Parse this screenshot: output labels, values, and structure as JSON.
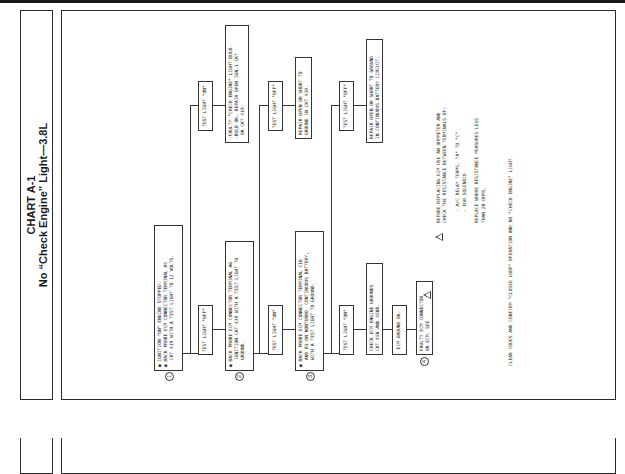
{
  "chart": {
    "id": "CHART A-1",
    "title": "No “Check Engine” Light—3.8L"
  },
  "steps": {
    "s1": {
      "num": "1",
      "lines": [
        "IGNITION \"ON\" ENGINE STOPPED.",
        "BACK PROBE ECM CONNECTOR TERMINAL A5",
        "CKT 419 WITH A TEST LIGHT TO 12 VOLTS."
      ]
    },
    "s2": {
      "num": "2",
      "lines": [
        "BACK PROBE ECM CONNECTOR TERMINAL A6",
        "IGNITION CKT 439 WITH A TEST LIGHT TO",
        "GROUND."
      ]
    },
    "s3": {
      "num": "3",
      "lines": [
        "BACK PROBE ECM CONNECTOR TERMINAL C16",
        "AND B1 ON NONTURBO. CONTINUOUS BATTERY,",
        "WITH A TEST LIGHT TO GROUND."
      ]
    },
    "s4": {
      "num": "4",
      "lines": [
        "FAULTY ECM CONNECTOR",
        "OR ECM. SEE"
      ]
    }
  },
  "results": {
    "r1_off": "TEST LIGHT \"OFF\"",
    "r1_on": "TEST LIGHT \"ON\"",
    "r1_on_fix": [
      "-FAULTY \"CHECK ENGINE\" LIGHT BULB.",
      "-BULB OK. REPAIR OPEN IGN.1 CKT",
      "OR CKT 419."
    ],
    "r2_on": "TEST LIGHT \"ON\"",
    "r2_off": "TEST LIGHT \"OFF\"",
    "r2_off_fix": [
      "REPAIR OPEN OR SHORT TO",
      "GROUND IN CKT 439."
    ],
    "r3_on": "TEST LIGHT \"ON\"",
    "r3_off": "TEST LIGHT \"OFF\"",
    "r3_off_fix": [
      "REPAIR OPEN OR SHORT TO GROUND",
      "IN CONTINUOUS BATTERY CIRCUIT."
    ],
    "ground_check": [
      "CHECK ECM ENGINE GROUNDS",
      "CKT 450 AND 450B."
    ],
    "ground_ok": "ECM GROUND OK."
  },
  "notes": {
    "warning": "BEFORE REPLACING ECM USE AN OHMMETER AND\nCHECK THE RESISTANCE BETWEEN TERMINALS OF:\n\n    - A/C RELAY TERMS. \"A\" TO \"C\"\n    - EGR SOLENOID\n\nREPLACE WHERE RESISTANCE MEASURES LESS\nTHAN 20 OHMS.",
    "final": "CLEAR CODES AND CONFIRM \"CLOSED LOOP\" OPERATION AND NO \"CHECK ENGINE\" LIGHT."
  }
}
